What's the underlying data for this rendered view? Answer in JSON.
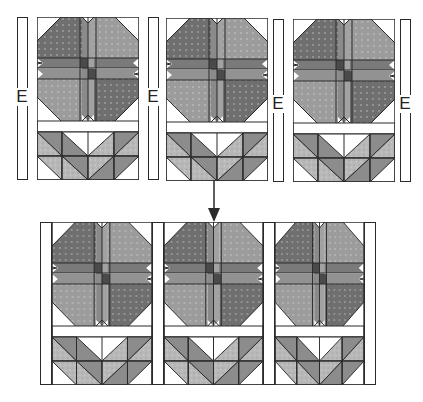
{
  "diagram": {
    "colors": {
      "outline": "#2a2a2a",
      "petal_dark": "#6f6f6f",
      "petal_light": "#9a9a9a",
      "center_dark": "#4a4a4a",
      "leaf_dark": "#8c8c8c",
      "leaf_light": "#b5b5b5",
      "background": "#ffffff"
    },
    "top_row": {
      "strip_label": "E",
      "blocks": [
        {
          "id": "block-1"
        },
        {
          "id": "block-2"
        },
        {
          "id": "block-3"
        }
      ],
      "strips": [
        {
          "label": "E"
        },
        {
          "label": "E"
        },
        {
          "label": "E"
        },
        {
          "label": "E"
        }
      ]
    },
    "arrow": {
      "direction": "down"
    },
    "bottom_row": {
      "blocks": [
        {
          "id": "block-1"
        },
        {
          "id": "block-2"
        },
        {
          "id": "block-3"
        }
      ]
    }
  }
}
